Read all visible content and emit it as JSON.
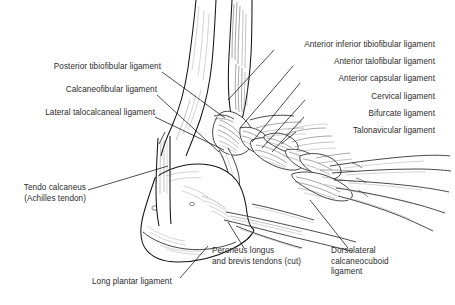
{
  "figure": {
    "background_color": "#ffffff",
    "ink_color": "#1a1a1a",
    "text_color": "#2c2c2c",
    "leader_color": "#111111"
  },
  "labels": {
    "left": [
      {
        "id": "posterior-tibiofibular-ligament",
        "text": "Posterior tibiofibular ligament",
        "x": 40,
        "y": 66,
        "align": "right",
        "leader": {
          "x1": 162,
          "y1": 72,
          "x2": 225,
          "y2": 118
        }
      },
      {
        "id": "calcaneofibular-ligament",
        "text": "Calcaneofibular ligament",
        "x": 48,
        "y": 89,
        "align": "right",
        "leader": {
          "x1": 157,
          "y1": 95,
          "x2": 219,
          "y2": 152
        }
      },
      {
        "id": "lateral-talocalcaneal-ligament",
        "text": "Lateral talocalcaneal ligament",
        "x": 20,
        "y": 112,
        "align": "right",
        "leader": {
          "x1": 155,
          "y1": 117,
          "x2": 224,
          "y2": 150
        }
      },
      {
        "id": "tendo-calcaneus",
        "text": "Tendo calcaneus",
        "sub": "(Achilles tendon)",
        "x": 30,
        "y": 190,
        "align": "right",
        "leader": {
          "x1": 88,
          "y1": 190,
          "x2": 168,
          "y2": 166
        }
      }
    ],
    "right": [
      {
        "id": "anterior-inferior-tibiofibular-ligament",
        "text": "Anterior inferior tibiofibular ligament",
        "x": 277,
        "y": 42,
        "align": "right",
        "leader": {
          "x1": 274,
          "y1": 50,
          "x2": 228,
          "y2": 100
        }
      },
      {
        "id": "anterior-talofibular-ligament",
        "text": "Anterior talofibular ligament",
        "x": 296,
        "y": 59,
        "align": "right",
        "leader": {
          "x1": 293,
          "y1": 66,
          "x2": 240,
          "y2": 128
        }
      },
      {
        "id": "anterior-capsular-ligament",
        "text": "Anterior capsular ligament",
        "x": 303,
        "y": 76,
        "align": "right",
        "leader": {
          "x1": 300,
          "y1": 83,
          "x2": 252,
          "y2": 142
        }
      },
      {
        "id": "cervical-ligament",
        "text": "Cervical ligament",
        "x": 307,
        "y": 95,
        "align": "right",
        "leader": {
          "x1": 305,
          "y1": 100,
          "x2": 262,
          "y2": 148
        }
      },
      {
        "id": "bifurcate-ligament",
        "text": "Bifurcate ligament",
        "x": 306,
        "y": 112,
        "align": "right",
        "leader": {
          "x1": 304,
          "y1": 117,
          "x2": 272,
          "y2": 152
        }
      },
      {
        "id": "talonavicular-ligament",
        "text": "Talonavicular ligament",
        "x": 298,
        "y": 129,
        "align": "right",
        "leader": {
          "x1": 296,
          "y1": 132,
          "x2": 281,
          "y2": 144
        }
      }
    ],
    "bottom": [
      {
        "id": "long-plantar-ligament",
        "text": "Long plantar ligament",
        "x": 92,
        "y": 281,
        "align": "left",
        "leader": {
          "x1": 180,
          "y1": 278,
          "x2": 208,
          "y2": 246
        }
      },
      {
        "id": "peroneus-longus-brevis-tendons",
        "text": "Peroneus longus",
        "sub": "and brevis tendons (cut)",
        "x": 212,
        "y": 250,
        "align": "left",
        "leader": {
          "x1": 244,
          "y1": 248,
          "x2": 228,
          "y2": 222
        }
      },
      {
        "id": "dorsolateral-calcaneocuboid-ligament",
        "text": "Dorsolateral",
        "sub": "calcaneocuboid",
        "sub2": "ligament",
        "x": 331,
        "y": 250,
        "align": "left",
        "leader": {
          "x1": 348,
          "y1": 248,
          "x2": 310,
          "y2": 200
        }
      }
    ]
  },
  "structures": [
    {
      "name": "tibia",
      "region": "upper-left-shaft"
    },
    {
      "name": "fibula",
      "region": "upper-right-shaft"
    },
    {
      "name": "lateral-malleolus",
      "region": "mid"
    },
    {
      "name": "talus",
      "region": "mid"
    },
    {
      "name": "calcaneus",
      "region": "lower-left"
    },
    {
      "name": "navicular",
      "region": "mid-right"
    },
    {
      "name": "cuboid",
      "region": "lower-right"
    },
    {
      "name": "metatarsals",
      "region": "right"
    }
  ]
}
